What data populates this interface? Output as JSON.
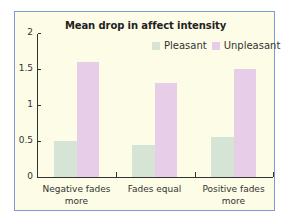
{
  "chart_data": {
    "type": "bar",
    "title": "Mean drop in affect intensity",
    "xlabel": "",
    "ylabel": "",
    "categories": [
      "Negative fades more",
      "Fades equal",
      "Positive fades more"
    ],
    "category_lines": [
      [
        "Negative fades",
        "more"
      ],
      [
        "Fades equal",
        ""
      ],
      [
        "Positive fades",
        "more"
      ]
    ],
    "series": [
      {
        "name": "Pleasant",
        "color": "#d5e4d5",
        "values": [
          0.5,
          0.44,
          0.56
        ]
      },
      {
        "name": "Unpleasant",
        "color": "#e8cde8",
        "values": [
          1.6,
          1.3,
          1.5
        ]
      }
    ],
    "ylim": [
      0,
      2
    ],
    "yticks": [
      "0",
      "0.5",
      "1",
      "1.5",
      "2"
    ],
    "grid": false,
    "legend_position": "top-right"
  },
  "colors": {
    "background": "#fdfce6",
    "border": "#7b9bd1",
    "pleasant": "#d5e4d5",
    "unpleasant": "#e8cde8"
  }
}
